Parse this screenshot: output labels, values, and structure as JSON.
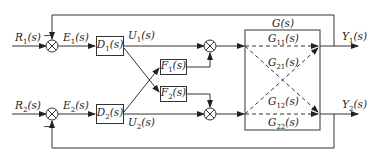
{
  "diagram": {
    "inputs": {
      "r1": {
        "sym": "R",
        "sub": "1",
        "arg": "(s)"
      },
      "r2": {
        "sym": "R",
        "sub": "2",
        "arg": "(s)"
      }
    },
    "errors": {
      "e1": {
        "sym": "E",
        "sub": "1",
        "arg": "(s)"
      },
      "e2": {
        "sym": "E",
        "sub": "2",
        "arg": "(s)"
      }
    },
    "controllers": {
      "d1": {
        "sym": "D",
        "sub": "1",
        "arg": "(s)"
      },
      "d2": {
        "sym": "D",
        "sub": "2",
        "arg": "(s)"
      }
    },
    "controls": {
      "u1": {
        "sym": "U",
        "sub": "1",
        "arg": "(s)"
      },
      "u2": {
        "sym": "U",
        "sub": "2",
        "arg": "(s)"
      }
    },
    "decouplers": {
      "f1": {
        "sym": "F",
        "sub": "1",
        "arg": "(s)"
      },
      "f2": {
        "sym": "F",
        "sub": "2",
        "arg": "(s)"
      }
    },
    "plant": {
      "label": {
        "sym": "G",
        "sub": "",
        "arg": "(s)"
      },
      "g11": {
        "sym": "G",
        "sub": "11",
        "arg": "(s)"
      },
      "g21": {
        "sym": "G",
        "sub": "21",
        "arg": "(s)"
      },
      "g12": {
        "sym": "G",
        "sub": "12",
        "arg": "(s)"
      },
      "g22": {
        "sym": "G",
        "sub": "22",
        "arg": "(s)"
      }
    },
    "outputs": {
      "y1": {
        "sym": "Y",
        "sub": "1",
        "arg": "(s)"
      },
      "y2": {
        "sym": "Y",
        "sub": "2",
        "arg": "(s)"
      }
    },
    "feedback_sign": "−",
    "colors": {
      "line": "#333333",
      "background": "#ffffff",
      "text": "#222222"
    }
  }
}
